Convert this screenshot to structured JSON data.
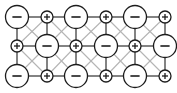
{
  "figure": {
    "name": "ionic-lattice-diagram",
    "background_color": "#ffffff",
    "width": 177,
    "height": 93
  },
  "legend": {
    "anion_symbol": "−",
    "cation_symbol": "+",
    "anion_description": "large circle, negative charge",
    "cation_description": "small circle, positive charge"
  },
  "style": {
    "ortho_bond_color": "#5a5a5a",
    "diagonal_bond_color": "#b4b4b4",
    "node_stroke_color": "#1c1c1c",
    "node_fill_color": "#ffffff"
  },
  "lattice": {
    "columns": 6,
    "rows": 3,
    "column_x": [
      17,
      47,
      76,
      106,
      135,
      165
    ],
    "row_y": [
      17,
      46,
      76
    ],
    "radius_large": 11.5,
    "radius_small": 6.0,
    "nodes": [
      [
        {
          "sign": "−",
          "charge": "negative",
          "size": "large",
          "col": 1,
          "row": 1
        },
        {
          "sign": "+",
          "charge": "positive",
          "size": "small",
          "col": 2,
          "row": 1
        },
        {
          "sign": "−",
          "charge": "negative",
          "size": "large",
          "col": 3,
          "row": 1
        },
        {
          "sign": "+",
          "charge": "positive",
          "size": "small",
          "col": 4,
          "row": 1
        },
        {
          "sign": "−",
          "charge": "negative",
          "size": "large",
          "col": 5,
          "row": 1
        },
        {
          "sign": "+",
          "charge": "positive",
          "size": "small",
          "col": 6,
          "row": 1
        }
      ],
      [
        {
          "sign": "+",
          "charge": "positive",
          "size": "small",
          "col": 1,
          "row": 2
        },
        {
          "sign": "−",
          "charge": "negative",
          "size": "large",
          "col": 2,
          "row": 2
        },
        {
          "sign": "+",
          "charge": "positive",
          "size": "small",
          "col": 3,
          "row": 2
        },
        {
          "sign": "−",
          "charge": "negative",
          "size": "large",
          "col": 4,
          "row": 2
        },
        {
          "sign": "+",
          "charge": "positive",
          "size": "small",
          "col": 5,
          "row": 2
        },
        {
          "sign": "−",
          "charge": "negative",
          "size": "large",
          "col": 6,
          "row": 2
        }
      ],
      [
        {
          "sign": "−",
          "charge": "negative",
          "size": "large",
          "col": 1,
          "row": 3
        },
        {
          "sign": "+",
          "charge": "positive",
          "size": "small",
          "col": 2,
          "row": 3
        },
        {
          "sign": "−",
          "charge": "negative",
          "size": "large",
          "col": 3,
          "row": 3
        },
        {
          "sign": "+",
          "charge": "positive",
          "size": "small",
          "col": 4,
          "row": 3
        },
        {
          "sign": "−",
          "charge": "negative",
          "size": "large",
          "col": 5,
          "row": 3
        },
        {
          "sign": "+",
          "charge": "positive",
          "size": "small",
          "col": 6,
          "row": 3
        }
      ]
    ]
  }
}
